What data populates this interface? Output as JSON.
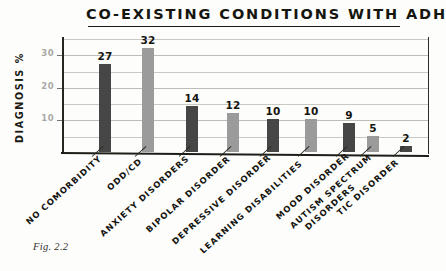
{
  "figure": {
    "caption": "Fig. 2.2"
  },
  "chart_data": {
    "type": "bar",
    "title": "CO-EXISTING  CONDITIONS  WITH  ADHD",
    "xlabel": "",
    "ylabel": "DIAGNOSIS %",
    "ylim": [
      0,
      35
    ],
    "ytick_labels": [
      "10",
      "20",
      "30"
    ],
    "ytick_values": [
      10,
      20,
      30
    ],
    "gridline_values": [
      5,
      10,
      15,
      20,
      25,
      30,
      35
    ],
    "grid": true,
    "legend": "none",
    "categories": [
      "NO COMORBIDITY",
      "ODD/CD",
      "ANXIETY DISORDERS",
      "BIPOLAR DISORDER",
      "DEPRESSIVE DISORDER",
      "LEARNING DISABILITIES",
      "MOOD DISORDER",
      "AUTISM SPECTRUM\nDISORDERS",
      "TIC DISORDER"
    ],
    "values": [
      27,
      32,
      14,
      12,
      10,
      10,
      9,
      5,
      2
    ],
    "value_labels": [
      "27",
      "32",
      "14",
      "12",
      "10",
      "10",
      "9",
      "5",
      "2"
    ],
    "bar_colors": [
      "#464646",
      "#9b9b9b",
      "#464646",
      "#9b9b9b",
      "#464646",
      "#9b9b9b",
      "#464646",
      "#9b9b9b",
      "#464646"
    ],
    "palette": {
      "dark": "#464646",
      "light": "#9b9b9b",
      "axis": "#1e1e18",
      "grid": "#c9c9c4",
      "tick_text": "#a9a9a4",
      "text": "#15150f",
      "background": "#fdfdfc"
    }
  }
}
